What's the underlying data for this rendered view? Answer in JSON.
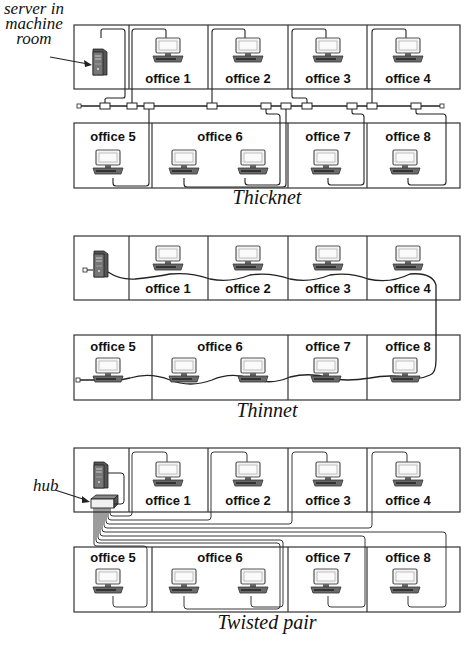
{
  "diagrams": [
    {
      "id": "thicknet",
      "caption": "Thicknet",
      "annotation": "server in machine room",
      "annotation_lines": [
        "server in",
        "machine",
        "room"
      ],
      "top_row": [
        "office 1",
        "office 2",
        "office 3",
        "office 4"
      ],
      "bottom_row": [
        "office 5",
        "office 6",
        "office 7",
        "office 8"
      ]
    },
    {
      "id": "thinnet",
      "caption": "Thinnet",
      "top_row": [
        "office 1",
        "office 2",
        "office 3",
        "office 4"
      ],
      "bottom_row": [
        "office 5",
        "office 6",
        "office 7",
        "office 8"
      ]
    },
    {
      "id": "twisted-pair",
      "caption": "Twisted pair",
      "annotation": "hub",
      "top_row": [
        "office 1",
        "office 2",
        "office 3",
        "office 4"
      ],
      "bottom_row": [
        "office 5",
        "office 6",
        "office 7",
        "office 8"
      ]
    }
  ],
  "icons": {
    "server": "server-tower-icon",
    "workstation": "workstation-icon",
    "transceiver": "transceiver-icon",
    "terminator": "terminator-icon",
    "hub": "hub-icon"
  },
  "colors": {
    "line": "#222222",
    "box_border": "#333333",
    "monitor_fill": "#f2f2f2",
    "base_fill": "#555555",
    "server_fill": "#444444"
  }
}
